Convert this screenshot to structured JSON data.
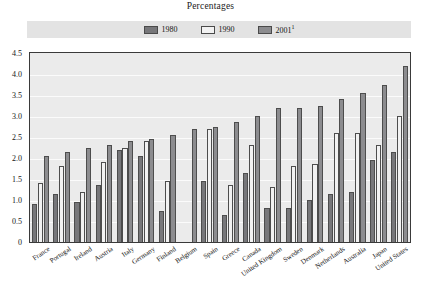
{
  "chart_data": {
    "type": "bar",
    "title": "Percentages",
    "xlabel": "",
    "ylabel": "",
    "ylim": [
      0,
      4.5
    ],
    "ytick_labels": [
      "4.5",
      "4.0",
      "3.5",
      "3.0",
      "2.5",
      "2.0",
      "1.5",
      "1.0",
      "0.5",
      "0"
    ],
    "ytick_values": [
      4.5,
      4.0,
      3.5,
      3.0,
      2.5,
      2.0,
      1.5,
      1.0,
      0.5,
      0
    ],
    "grid": true,
    "legend_position": "top",
    "categories": [
      "France",
      "Portugal",
      "Ireland",
      "Austria",
      "Italy",
      "Germany",
      "Finland",
      "Belgium",
      "Spain",
      "Greece",
      "Canada",
      "United Kingdom",
      "Sweden",
      "Denmark",
      "Netherlands",
      "Australia",
      "Japan",
      "United States"
    ],
    "series": [
      {
        "name": "1980",
        "color": "#77777a",
        "values": [
          0.9,
          1.15,
          0.95,
          1.35,
          2.2,
          2.05,
          0.75,
          null,
          1.45,
          0.65,
          1.65,
          0.8,
          0.8,
          1.0,
          1.15,
          1.2,
          1.95,
          2.15
        ]
      },
      {
        "name": "1990",
        "color": "#f2f2f2",
        "values": [
          1.4,
          1.8,
          1.2,
          1.9,
          2.25,
          2.4,
          1.45,
          null,
          2.7,
          1.35,
          2.3,
          1.3,
          1.8,
          1.85,
          2.6,
          2.6,
          2.3,
          3.0
        ]
      },
      {
        "name": "2001",
        "color": "#8c8c8f",
        "values": [
          2.05,
          2.15,
          2.25,
          2.3,
          2.4,
          2.45,
          2.55,
          2.7,
          2.75,
          2.85,
          3.0,
          3.2,
          3.2,
          3.25,
          3.4,
          3.55,
          3.75,
          4.2
        ]
      }
    ]
  },
  "legend": {
    "entries": [
      {
        "label": "1980",
        "sup": ""
      },
      {
        "label": "1990",
        "sup": ""
      },
      {
        "label": "2001",
        "sup": "1"
      }
    ]
  }
}
